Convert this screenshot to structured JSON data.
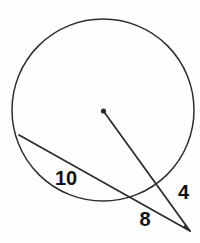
{
  "figure": {
    "kind": "circle-secant-geometry-diagram",
    "labels": {
      "chord": "10",
      "secant_external_segment": "8",
      "center_line_external_segment": "4"
    },
    "colors": {
      "line": "#2e2e2e",
      "text": "#121212",
      "background": "#fefefe"
    }
  }
}
